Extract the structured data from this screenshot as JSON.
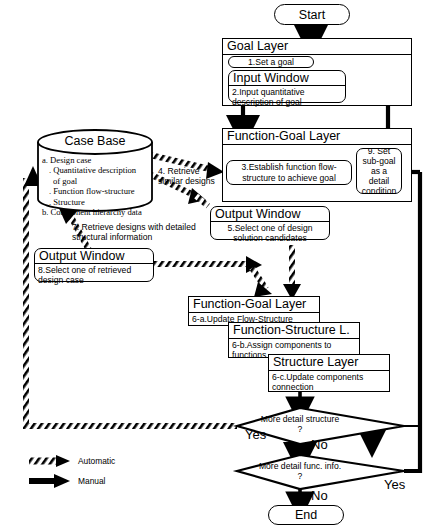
{
  "diagram": {
    "start_label": "Start",
    "end_label": "End",
    "legend": [
      {
        "key": "automatic",
        "label": "Automatic",
        "style": "hatched-arrow"
      },
      {
        "key": "manual",
        "label": "Manual",
        "style": "solid-arrow"
      }
    ],
    "layers": {
      "goal_layer": {
        "header": "Goal Layer",
        "step1": "1.Set a goal",
        "input_window": {
          "header": "Input Window",
          "body": "2.Input quantitative description of  goal"
        }
      },
      "function_goal_layer": {
        "header": "Function-Goal Layer",
        "step3": "3.Establish function flow-structure to achieve goal",
        "step9": "9. Set sub-goal as a detail condition"
      },
      "output_window_5": {
        "header": "Output Window",
        "body": "5.Select one of design solution candidates"
      },
      "output_window_8": {
        "header": "Output Window",
        "body": "8.Select one of retrieved design case"
      },
      "function_goal_layer_6a": {
        "header": "Function-Goal Layer",
        "body": "6-a.Update Flow-Structure"
      },
      "function_structure_layer_6b": {
        "header": "Function-Structure L.",
        "body": "6-b.Assign components to functions"
      },
      "structure_layer_6c": {
        "header": "Structure Layer",
        "body": "6-c.Update components connection"
      }
    },
    "case_base": {
      "title": "Case Base",
      "lines": [
        "a. Design case",
        ". Quantitative description",
        "of goal",
        ". Function flow-structure",
        ". Structure",
        "b. Component hierarchy data"
      ]
    },
    "edge_labels": {
      "retrieve_similar": "4. Retrieve similar designs",
      "retrieve_detailed": "7. Retrieve designs with detailed structural information"
    },
    "decisions": [
      {
        "id": "more-detail-structure",
        "text": "More detail structure ?",
        "yes_label": "Yes",
        "no_label": "No"
      },
      {
        "id": "more-detail-func",
        "text": "More detail func. info. ?",
        "yes_label": "Yes",
        "no_label": "No"
      }
    ],
    "colors": {
      "stroke": "#000000",
      "fill": "#ffffff"
    }
  }
}
